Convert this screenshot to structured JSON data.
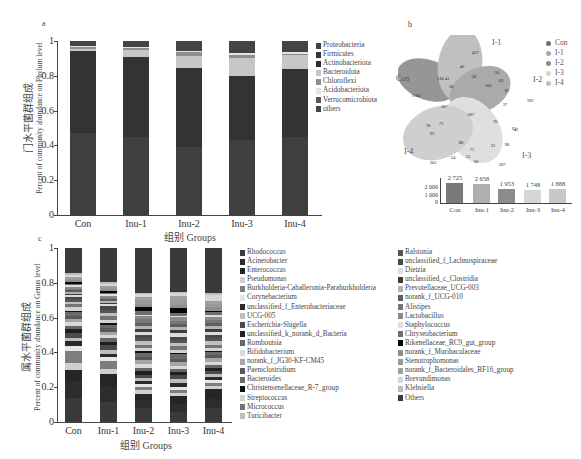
{
  "chart_data": [
    {
      "panel": "a",
      "type": "bar",
      "stacked": true,
      "title": "",
      "xlabel": "组别 Groups",
      "ylabel_cn": "门水平菌群组成",
      "ylabel": "Percent of community abundance on Phylum level",
      "ylim": [
        0,
        1
      ],
      "yticks": [
        "0",
        "0.2",
        "0.4",
        "0.6",
        "0.8",
        "1"
      ],
      "categories": [
        "Con",
        "Inu-1",
        "Inu-2",
        "Inu-3",
        "Inu-4"
      ],
      "series": [
        {
          "name": "Proteobacteria",
          "color": "#3f3f3f",
          "values": [
            0.47,
            0.45,
            0.39,
            0.43,
            0.45
          ]
        },
        {
          "name": "Firmicutes",
          "color": "#333333",
          "values": [
            0.47,
            0.46,
            0.45,
            0.37,
            0.39
          ]
        },
        {
          "name": "Actinobacteriota",
          "color": "#2e2e2e",
          "values": [
            0.0,
            0.0,
            0.0,
            0.0,
            0.0
          ]
        },
        {
          "name": "Bacteroidota",
          "color": "#c6c6c6",
          "values": [
            0.015,
            0.04,
            0.07,
            0.1,
            0.08
          ]
        },
        {
          "name": "Chloroflexi",
          "color": "#8e8e8e",
          "values": [
            0.01,
            0.008,
            0.02,
            0.02,
            0.008
          ]
        },
        {
          "name": "Acidobacteriota",
          "color": "#e4e4e4",
          "values": [
            0.008,
            0.01,
            0.01,
            0.01,
            0.01
          ]
        },
        {
          "name": "Verrucomicrobiota",
          "color": "#5a5a5a",
          "values": [
            0.0,
            0.0,
            0.0,
            0.0,
            0.0
          ]
        },
        {
          "name": "others",
          "color": "#444444",
          "values": [
            0.027,
            0.032,
            0.055,
            0.07,
            0.062
          ]
        }
      ],
      "legend_position": "right"
    },
    {
      "panel": "b",
      "type": "venn",
      "sets": [
        "Con",
        "I-1",
        "I-2",
        "I-3",
        "I-4"
      ],
      "set_colors": [
        "#6e6e6e",
        "#a8a8a8",
        "#8a8a8a",
        "#d4d4d4",
        "#bdbdbd"
      ],
      "unique_counts": {
        "Con": 1102,
        "I-1": 437,
        "I-2": 392,
        "I-3": 207,
        "I-4": 302
      },
      "core_count": 667,
      "region_values": [
        1102,
        437,
        392,
        207,
        302,
        667,
        46,
        130,
        41,
        50,
        50,
        63,
        103,
        87,
        37,
        58,
        107,
        73,
        78,
        92,
        88,
        70,
        42,
        63,
        71,
        31,
        98,
        54,
        53,
        60
      ],
      "inset_bar": {
        "type": "bar",
        "categories": [
          "Con",
          "Inu-1",
          "Inu-2",
          "Inu-3",
          "Inu-4"
        ],
        "values": [
          2725,
          2658,
          1953,
          1748,
          1888
        ],
        "value_labels": [
          "2 725",
          "2 658",
          "1 953",
          "1 748",
          "1 888"
        ],
        "yticks": [
          "0",
          "1 000",
          "2 000"
        ],
        "colors": [
          "#7a7a7a",
          "#b0b0b0",
          "#8c8c8c",
          "#d6d6d6",
          "#c8c8c8"
        ]
      }
    },
    {
      "panel": "c",
      "type": "bar",
      "stacked": true,
      "xlabel": "组别 Groups",
      "ylabel_cn": "属水平菌群组成",
      "ylabel": "Percent of community abundance on Genus level",
      "ylim": [
        0,
        1
      ],
      "yticks": [
        "0",
        "0.2",
        "0.4",
        "0.6",
        "0.8",
        "1"
      ],
      "categories": [
        "Con",
        "Inu-1",
        "Inu-2",
        "Inu-3",
        "Inu-4"
      ],
      "series": [
        {
          "name": "Rhodococcus",
          "color": "#3a3a3a",
          "values": [
            0.14,
            0.12,
            0.09,
            0.06,
            0.09
          ]
        },
        {
          "name": "Acinetobacter",
          "color": "#2c2c2c",
          "values": [
            0.1,
            0.09,
            0.05,
            0.05,
            0.06
          ]
        },
        {
          "name": "Enterococcus",
          "color": "#252525",
          "values": [
            0.07,
            0.07,
            0.04,
            0.05,
            0.06
          ]
        },
        {
          "name": "Pseudomonas",
          "color": "#cfcfcf",
          "values": [
            0.04,
            0.03,
            0.02,
            0.02,
            0.02
          ]
        },
        {
          "name": "Burkholderia-Caballeronia-Paraburkholderia",
          "color": "#7d7d7d",
          "values": [
            0.07,
            0.05,
            0.02,
            0.02,
            0.02
          ]
        },
        {
          "name": "Corynebacterium",
          "color": "#e6e6e6",
          "values": [
            0.03,
            0.02,
            0.02,
            0.02,
            0.02
          ]
        },
        {
          "name": "unclassified_f_Enterobacteriaceae",
          "color": "#2a2a2a",
          "values": [
            0.03,
            0.02,
            0.02,
            0.02,
            0.02
          ]
        },
        {
          "name": "UCG-005",
          "color": "#bdbdbd",
          "values": [
            0.02,
            0.02,
            0.02,
            0.03,
            0.02
          ]
        },
        {
          "name": "Escherichia-Shigella",
          "color": "#4a4a4a",
          "values": [
            0.03,
            0.03,
            0.02,
            0.02,
            0.02
          ]
        },
        {
          "name": "unclassified_k_norank_d_Bacteria",
          "color": "#1f1f1f",
          "values": [
            0.02,
            0.02,
            0.02,
            0.02,
            0.02
          ]
        },
        {
          "name": "Romboutsia",
          "color": "#666666",
          "values": [
            0.02,
            0.02,
            0.02,
            0.02,
            0.02
          ]
        },
        {
          "name": "Bifidobacterium",
          "color": "#d9d9d9",
          "values": [
            0.02,
            0.02,
            0.03,
            0.02,
            0.02
          ]
        },
        {
          "name": "norank_f_JG30-KF-CM45",
          "color": "#a5a5a5",
          "values": [
            0.02,
            0.02,
            0.02,
            0.02,
            0.02
          ]
        },
        {
          "name": "Paeniclostridium",
          "color": "#595959",
          "values": [
            0.02,
            0.02,
            0.02,
            0.02,
            0.02
          ]
        },
        {
          "name": "Bacteroides",
          "color": "#6a6a6a",
          "values": [
            0.02,
            0.02,
            0.03,
            0.03,
            0.02
          ]
        },
        {
          "name": "Christensenellaceae_R-7_group",
          "color": "#111111",
          "values": [
            0.01,
            0.01,
            0.01,
            0.01,
            0.01
          ]
        },
        {
          "name": "Streptococcus",
          "color": "#d2d2d2",
          "values": [
            0.02,
            0.02,
            0.02,
            0.02,
            0.02
          ]
        },
        {
          "name": "Micrococcus",
          "color": "#747474",
          "values": [
            0.02,
            0.02,
            0.02,
            0.02,
            0.02
          ]
        },
        {
          "name": "Turicibacter",
          "color": "#c0c0c0",
          "values": [
            0.01,
            0.02,
            0.02,
            0.02,
            0.02
          ]
        },
        {
          "name": "Ralstonia",
          "color": "#555555",
          "values": [
            0.02,
            0.02,
            0.02,
            0.02,
            0.02
          ]
        },
        {
          "name": "unclassified_f_Lachnospiraceae",
          "color": "#484848",
          "values": [
            0.01,
            0.02,
            0.02,
            0.02,
            0.02
          ]
        },
        {
          "name": "Dietzia",
          "color": "#dcdcdc",
          "values": [
            0.01,
            0.01,
            0.02,
            0.02,
            0.02
          ]
        },
        {
          "name": "unclassified_c_Clostridia",
          "color": "#3c3c3c",
          "values": [
            0.01,
            0.01,
            0.02,
            0.02,
            0.02
          ]
        },
        {
          "name": "Prevotellaceae_UCG-003",
          "color": "#b3b3b3",
          "values": [
            0.01,
            0.01,
            0.02,
            0.02,
            0.02
          ]
        },
        {
          "name": "norank_f_UCG-010",
          "color": "#5e5e5e",
          "values": [
            0.01,
            0.01,
            0.02,
            0.02,
            0.02
          ]
        },
        {
          "name": "Alistipes",
          "color": "#777777",
          "values": [
            0.01,
            0.01,
            0.02,
            0.02,
            0.02
          ]
        },
        {
          "name": "Lactobacillus",
          "color": "#8a8a8a",
          "values": [
            0.01,
            0.01,
            0.02,
            0.02,
            0.02
          ]
        },
        {
          "name": "Staphylococcus",
          "color": "#e0e0e0",
          "values": [
            0.01,
            0.01,
            0.01,
            0.01,
            0.01
          ]
        },
        {
          "name": "Chryseobacterium",
          "color": "#6f6f6f",
          "values": [
            0.01,
            0.01,
            0.02,
            0.02,
            0.02
          ]
        },
        {
          "name": "Rikenellaceae_RC9_gut_group",
          "color": "#050505",
          "values": [
            0.01,
            0.01,
            0.03,
            0.03,
            0.01
          ]
        },
        {
          "name": "norank_f_Muribaculaceae",
          "color": "#8f8f8f",
          "values": [
            0.01,
            0.01,
            0.02,
            0.02,
            0.02
          ]
        },
        {
          "name": "Stenotrophomonas",
          "color": "#9a9a9a",
          "values": [
            0.01,
            0.01,
            0.02,
            0.02,
            0.02
          ]
        },
        {
          "name": "norank_f_Bacteroidales_RF16_group",
          "color": "#a0a0a0",
          "values": [
            0.01,
            0.01,
            0.02,
            0.03,
            0.02
          ]
        },
        {
          "name": "Brevundimonas",
          "color": "#d7d7d7",
          "values": [
            0.01,
            0.01,
            0.02,
            0.02,
            0.04
          ]
        },
        {
          "name": "Klebsiella",
          "color": "#bcbcbc",
          "values": [
            0.01,
            0.01,
            0.01,
            0.01,
            0.01
          ]
        },
        {
          "name": "Others",
          "color": "#3a3a3a",
          "values": [
            0.15,
            0.2,
            0.28,
            0.27,
            0.29
          ]
        }
      ],
      "legend_position": "right"
    }
  ],
  "panels": {
    "a": {
      "label": "a",
      "ylabel_cn": "门水平菌群组成",
      "ylabel_en": "Percent of community abundance on Phylum level",
      "xtitle": "组别 Groups"
    },
    "b": {
      "label": "b",
      "venn_labels": {
        "Con": "Con",
        "I1": "I-1",
        "I2": "I-2",
        "I3": "I-3",
        "I4": "I-4"
      }
    },
    "c": {
      "label": "c",
      "ylabel_cn": "属水平菌群组成",
      "ylabel_en": "Percent of community abundance on Genus level",
      "xtitle": "组别 Groups"
    }
  },
  "yticks": [
    "0",
    "0.2",
    "0.4",
    "0.6",
    "0.8",
    "1"
  ],
  "categories": [
    "Con",
    "Inu-1",
    "Inu-2",
    "Inu-3",
    "Inu-4"
  ],
  "inset": {
    "yticks": [
      "0",
      "1 000",
      "2 000"
    ]
  }
}
